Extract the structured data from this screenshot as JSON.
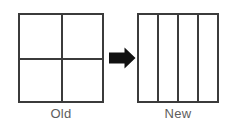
{
  "diagram": {
    "background_color": "#ffffff",
    "line_color": "#3b3b3b",
    "label_color": "#5d5d5d",
    "arrow_color": "#111111",
    "left_figure": {
      "label": "Old",
      "shape": "square",
      "columns": 2,
      "rows": 2,
      "vertical_dividers": 1,
      "horizontal_dividers": 1,
      "cells": 4
    },
    "right_figure": {
      "label": "New",
      "shape": "square",
      "columns": 4,
      "rows": 1,
      "vertical_dividers": 3,
      "horizontal_dividers": 0,
      "cells": 4
    },
    "arrow": {
      "name": "right-arrow",
      "direction": "right",
      "style": "solid-block"
    }
  }
}
